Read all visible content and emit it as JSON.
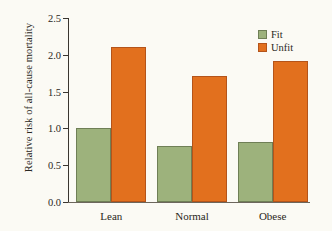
{
  "chart_data": {
    "type": "bar",
    "title": "",
    "xlabel": "",
    "ylabel": "Relative risk of all-cause mortality",
    "categories": [
      "Lean",
      "Normal",
      "Obese"
    ],
    "series": [
      {
        "name": "Fit",
        "values": [
          1.01,
          0.76,
          0.82
        ],
        "color": "#9db27c"
      },
      {
        "name": "Unfit",
        "values": [
          2.1,
          1.71,
          1.92
        ],
        "color": "#e2701e"
      }
    ],
    "ylim": [
      0.0,
      2.5
    ],
    "yticks": [
      "0.0",
      "0.5",
      "1.0",
      "1.5",
      "2.0",
      "2.5"
    ],
    "ytick_values": [
      0.0,
      0.5,
      1.0,
      1.5,
      2.0,
      2.5
    ],
    "grid": false,
    "legend_position": "top-right",
    "legend": [
      "Fit",
      "Unfit"
    ]
  }
}
